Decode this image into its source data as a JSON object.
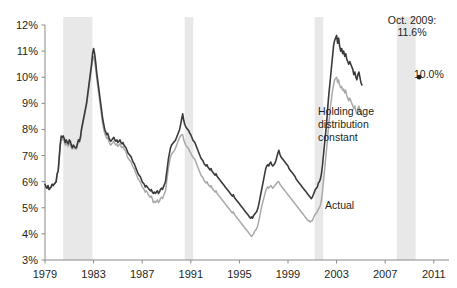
{
  "chart_data": {
    "type": "line",
    "title": "",
    "subtitle": "",
    "xlabel": "",
    "ylabel": "",
    "xlim": [
      1979.0,
      2012.25
    ],
    "ylim": [
      3,
      12
    ],
    "y_tick_labels": [
      "3%",
      "4%",
      "5%",
      "6%",
      "7%",
      "8%",
      "9%",
      "10%",
      "11%",
      "12%"
    ],
    "y_tick_values": [
      3,
      4,
      5,
      6,
      7,
      8,
      9,
      10,
      11,
      12
    ],
    "x_tick_labels": [
      "1979",
      "1983",
      "1987",
      "1991",
      "1995",
      "1999",
      "2003",
      "2007",
      "2011"
    ],
    "x_tick_values": [
      1979,
      1983,
      1987,
      1991,
      1995,
      1999,
      2003,
      2007,
      2011
    ],
    "grid": false,
    "legend_position": "inline-annotation",
    "colors": {
      "constant_age": "#3a3a3a",
      "actual": "#a9a9a9",
      "recession_band": "#e8e8e8",
      "axis": "#7f7f7f",
      "text": "#231f20"
    },
    "annotations": [
      {
        "name": "peak-callout",
        "text_line1": "Oct. 2009:",
        "text_line2": "11.6%",
        "x": 2009.79,
        "y": 11.6
      },
      {
        "name": "actual-peak-callout",
        "text": "10.0%",
        "x": 2009.79,
        "y": 10.0
      },
      {
        "name": "constant-series-label",
        "text_line1": "Holding age",
        "text_line2": "distribution",
        "text_line3": "constant",
        "x": 2002.2,
        "y": 8.8
      },
      {
        "name": "actual-series-label",
        "text": "Actual",
        "x": 2002.6,
        "y": 5.35
      }
    ],
    "recession_bands": [
      {
        "start": 1980.5,
        "end": 1982.9
      },
      {
        "start": 1990.5,
        "end": 1991.2
      },
      {
        "start": 2001.2,
        "end": 2001.9
      },
      {
        "start": 2007.95,
        "end": 2009.5
      }
    ],
    "series": [
      {
        "name": "Holding age distribution constant",
        "color": "#3a3a3a",
        "x_start": 1979.0,
        "x_step": 0.08333,
        "values": [
          5.9,
          5.8,
          5.75,
          5.85,
          5.7,
          5.75,
          5.8,
          5.9,
          5.85,
          5.9,
          5.95,
          6.0,
          6.3,
          6.4,
          6.9,
          7.4,
          7.75,
          7.7,
          7.75,
          7.65,
          7.5,
          7.6,
          7.5,
          7.45,
          7.6,
          7.55,
          7.4,
          7.3,
          7.4,
          7.35,
          7.3,
          7.3,
          7.45,
          7.6,
          7.55,
          7.7,
          8.0,
          8.2,
          8.4,
          8.6,
          8.8,
          9.0,
          9.3,
          9.6,
          9.9,
          10.2,
          10.5,
          10.9,
          11.1,
          10.9,
          10.6,
          10.2,
          9.9,
          9.6,
          9.3,
          9.0,
          8.7,
          8.4,
          8.2,
          8.0,
          7.9,
          7.8,
          7.85,
          7.7,
          7.6,
          7.55,
          7.6,
          7.65,
          7.7,
          7.6,
          7.55,
          7.6,
          7.5,
          7.55,
          7.6,
          7.5,
          7.45,
          7.5,
          7.4,
          7.35,
          7.3,
          7.2,
          7.1,
          7.05,
          7.0,
          6.95,
          6.85,
          6.75,
          6.7,
          6.6,
          6.5,
          6.4,
          6.3,
          6.25,
          6.2,
          6.1,
          6.0,
          5.95,
          5.9,
          5.8,
          5.85,
          5.8,
          5.75,
          5.7,
          5.65,
          5.7,
          5.6,
          5.55,
          5.6,
          5.55,
          5.6,
          5.65,
          5.55,
          5.6,
          5.7,
          5.75,
          5.7,
          5.8,
          5.9,
          6.0,
          6.3,
          6.6,
          6.9,
          7.1,
          7.3,
          7.4,
          7.45,
          7.5,
          7.55,
          7.6,
          7.7,
          7.8,
          7.9,
          8.0,
          8.2,
          8.4,
          8.6,
          8.35,
          8.2,
          8.1,
          8.05,
          8.0,
          7.95,
          7.85,
          7.8,
          7.7,
          7.6,
          7.55,
          7.5,
          7.4,
          7.3,
          7.2,
          7.1,
          7.0,
          6.9,
          6.85,
          6.8,
          6.7,
          6.65,
          6.6,
          6.65,
          6.55,
          6.5,
          6.45,
          6.5,
          6.4,
          6.35,
          6.3,
          6.25,
          6.3,
          6.2,
          6.15,
          6.1,
          6.05,
          6.0,
          5.95,
          5.9,
          5.85,
          5.8,
          5.75,
          5.7,
          5.65,
          5.6,
          5.55,
          5.5,
          5.45,
          5.5,
          5.4,
          5.35,
          5.3,
          5.25,
          5.2,
          5.15,
          5.1,
          5.05,
          5.0,
          4.95,
          4.9,
          4.85,
          4.8,
          4.75,
          4.7,
          4.65,
          4.6,
          4.65,
          4.6,
          4.7,
          4.75,
          4.8,
          4.85,
          4.95,
          5.1,
          5.3,
          5.5,
          5.7,
          5.9,
          6.1,
          6.3,
          6.5,
          6.6,
          6.65,
          6.6,
          6.7,
          6.75,
          6.65,
          6.6,
          6.65,
          6.7,
          6.8,
          6.95,
          7.1,
          7.2,
          7.05,
          6.95,
          6.9,
          6.85,
          6.8,
          6.75,
          6.7,
          6.65,
          6.6,
          6.5,
          6.45,
          6.4,
          6.35,
          6.3,
          6.25,
          6.2,
          6.1,
          6.05,
          6.0,
          5.95,
          5.9,
          5.85,
          5.8,
          5.75,
          5.7,
          5.65,
          5.6,
          5.55,
          5.5,
          5.45,
          5.4,
          5.35,
          5.4,
          5.5,
          5.6,
          5.7,
          5.75,
          5.8,
          5.95,
          6.0,
          6.1,
          6.3,
          6.6,
          7.0,
          7.4,
          7.8,
          8.2,
          8.7,
          9.2,
          9.6,
          10.0,
          10.4,
          10.8,
          11.2,
          11.4,
          11.5,
          11.6,
          11.3,
          11.5,
          11.2,
          11.0,
          11.1,
          10.9,
          11.0,
          10.8,
          10.9,
          10.7,
          10.6,
          10.5,
          10.6,
          10.5,
          10.4,
          10.3,
          10.1,
          10.2,
          10.0,
          9.9,
          10.1,
          10.2,
          10.0,
          9.8,
          9.7
        ]
      },
      {
        "name": "Actual",
        "color": "#a9a9a9",
        "x_start": 1979.0,
        "x_step": 0.08333,
        "values": [
          5.9,
          5.8,
          5.75,
          5.85,
          5.7,
          5.75,
          5.8,
          5.9,
          5.85,
          5.9,
          5.95,
          6.0,
          6.3,
          6.4,
          6.85,
          7.35,
          7.65,
          7.6,
          7.65,
          7.55,
          7.4,
          7.5,
          7.4,
          7.35,
          7.5,
          7.45,
          7.3,
          7.25,
          7.35,
          7.3,
          7.25,
          7.25,
          7.4,
          7.55,
          7.5,
          7.65,
          7.95,
          8.15,
          8.35,
          8.55,
          8.75,
          8.95,
          9.2,
          9.5,
          9.8,
          10.1,
          10.4,
          10.7,
          10.8,
          10.6,
          10.35,
          10.0,
          9.7,
          9.4,
          9.1,
          8.8,
          8.5,
          8.2,
          8.0,
          7.85,
          7.75,
          7.65,
          7.7,
          7.55,
          7.45,
          7.4,
          7.45,
          7.5,
          7.55,
          7.45,
          7.4,
          7.45,
          7.35,
          7.4,
          7.45,
          7.35,
          7.3,
          7.35,
          7.25,
          7.2,
          7.15,
          7.0,
          6.9,
          6.85,
          6.8,
          6.75,
          6.65,
          6.55,
          6.5,
          6.4,
          6.3,
          6.2,
          6.1,
          6.05,
          6.0,
          5.9,
          5.8,
          5.75,
          5.7,
          5.6,
          5.65,
          5.6,
          5.5,
          5.45,
          5.4,
          5.45,
          5.35,
          5.2,
          5.25,
          5.2,
          5.25,
          5.3,
          5.2,
          5.25,
          5.35,
          5.4,
          5.35,
          5.45,
          5.55,
          5.65,
          5.95,
          6.25,
          6.55,
          6.75,
          6.95,
          7.05,
          7.1,
          7.15,
          7.2,
          7.3,
          7.4,
          7.5,
          7.6,
          7.7,
          7.75,
          7.8,
          7.8,
          7.6,
          7.5,
          7.4,
          7.35,
          7.3,
          7.25,
          7.15,
          7.1,
          7.0,
          6.95,
          6.9,
          6.85,
          6.75,
          6.65,
          6.55,
          6.45,
          6.35,
          6.25,
          6.2,
          6.15,
          6.05,
          6.0,
          5.95,
          6.0,
          5.9,
          5.85,
          5.8,
          5.85,
          5.75,
          5.7,
          5.65,
          5.6,
          5.65,
          5.55,
          5.5,
          5.45,
          5.4,
          5.35,
          5.3,
          5.25,
          5.2,
          5.15,
          5.1,
          5.05,
          5.0,
          4.95,
          4.9,
          4.85,
          4.8,
          4.85,
          4.75,
          4.7,
          4.65,
          4.6,
          4.55,
          4.5,
          4.45,
          4.4,
          4.35,
          4.3,
          4.25,
          4.2,
          4.15,
          4.1,
          4.05,
          4.0,
          3.95,
          3.9,
          3.95,
          4.0,
          4.1,
          4.15,
          4.2,
          4.3,
          4.45,
          4.65,
          4.85,
          5.05,
          5.2,
          5.35,
          5.5,
          5.65,
          5.75,
          5.8,
          5.75,
          5.8,
          5.85,
          5.8,
          5.75,
          5.8,
          5.85,
          5.9,
          5.95,
          6.0,
          6.0,
          5.9,
          5.85,
          5.8,
          5.75,
          5.7,
          5.65,
          5.6,
          5.55,
          5.5,
          5.45,
          5.4,
          5.35,
          5.3,
          5.25,
          5.2,
          5.15,
          5.1,
          5.05,
          5.0,
          4.95,
          4.9,
          4.85,
          4.8,
          4.75,
          4.7,
          4.65,
          4.6,
          4.55,
          4.5,
          4.5,
          4.45,
          4.5,
          4.5,
          4.6,
          4.7,
          4.75,
          4.8,
          4.85,
          4.95,
          5.0,
          5.1,
          5.3,
          5.6,
          6.0,
          6.4,
          6.8,
          7.2,
          7.6,
          8.1,
          8.5,
          8.9,
          9.2,
          9.5,
          9.7,
          9.9,
          9.95,
          10.0,
          9.8,
          9.9,
          9.7,
          9.6,
          9.65,
          9.5,
          9.55,
          9.4,
          9.5,
          9.3,
          9.2,
          9.1,
          9.2,
          9.1,
          9.0,
          8.9,
          8.8,
          8.9,
          8.7,
          8.6,
          8.8,
          8.9,
          8.7,
          8.6,
          8.55
        ]
      }
    ]
  },
  "axis": {
    "y_labels": [
      "12%",
      "11%",
      "10%",
      "9%",
      "8%",
      "7%",
      "6%",
      "5%",
      "4%",
      "3%"
    ],
    "x_labels": [
      "1979",
      "1983",
      "1987",
      "1991",
      "1995",
      "1999",
      "2003",
      "2007",
      "2011"
    ]
  },
  "annotations": {
    "peak_line1": "Oct. 2009:",
    "peak_line2": "11.6%",
    "actual_peak": "10.0%",
    "constant_line1": "Holding age",
    "constant_line2": "distribution",
    "constant_line3": "constant",
    "actual_label": "Actual"
  }
}
